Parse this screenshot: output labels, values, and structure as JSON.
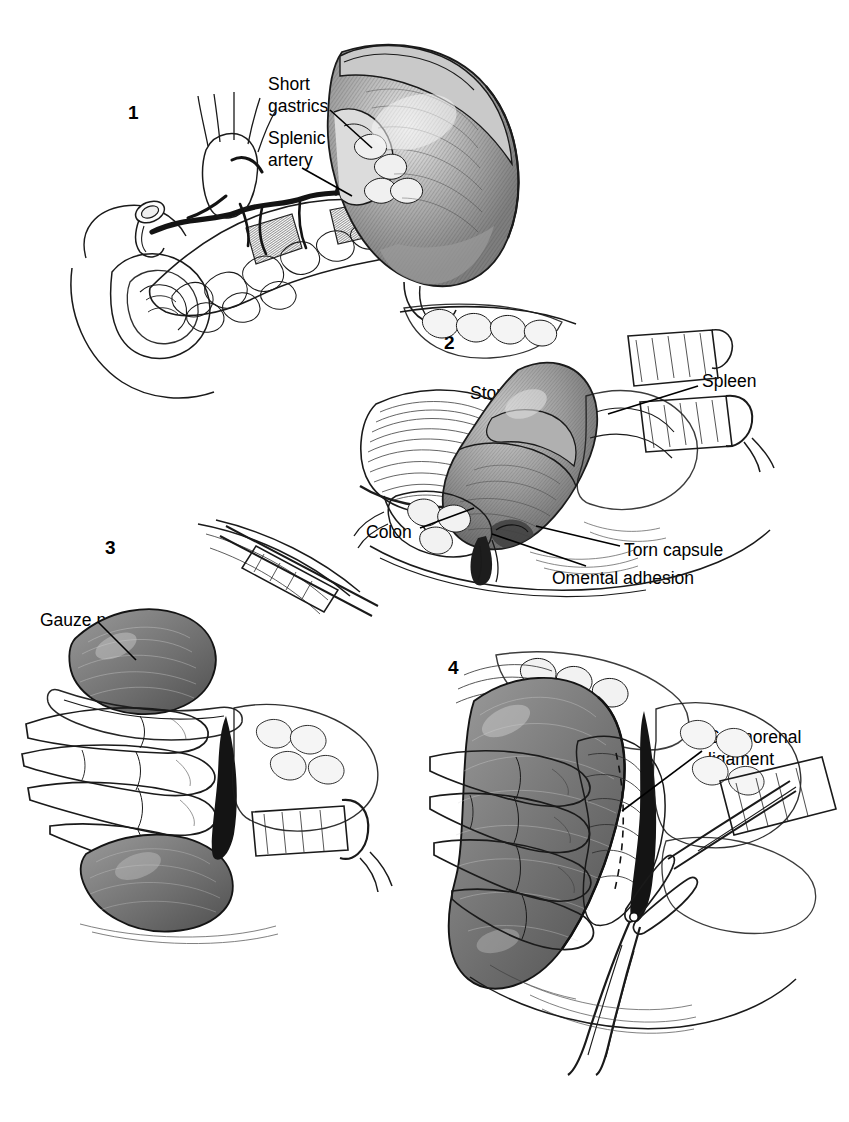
{
  "figure": {
    "background_color": "#ffffff",
    "ink_color": "#1a1a1a",
    "organ_fill_color": "#8e8e8e",
    "panel_count": 4
  },
  "panels": [
    {
      "number": "1",
      "caption": "Anatomy of the spleen, splenic artery and short gastric vessels along the tail of the pancreas",
      "labels": [
        {
          "id": "short-gastrics",
          "text": "Short\ngastrics",
          "line1": "Short",
          "line2": "gastrics"
        },
        {
          "id": "splenic-artery",
          "text": "Splenic\nartery",
          "line1": "Splenic",
          "line2": "artery"
        }
      ],
      "structures": [
        "spleen",
        "splenic artery",
        "short gastric vessels",
        "pancreas",
        "duodenum",
        "stomach outline"
      ]
    },
    {
      "number": "2",
      "caption": "Exposure of the injured spleen showing a torn capsule and omental adhesion",
      "labels": [
        {
          "id": "stomach",
          "text": "Stomach"
        },
        {
          "id": "spleen",
          "text": "Spleen"
        },
        {
          "id": "colon",
          "text": "Colon"
        },
        {
          "id": "torn-capsule",
          "text": "Torn capsule"
        },
        {
          "id": "omental-adhesion",
          "text": "Omental adhesion"
        }
      ],
      "structures": [
        "spleen",
        "stomach",
        "colon",
        "torn capsule",
        "omental adhesion",
        "retractors"
      ]
    },
    {
      "number": "3",
      "caption": "Hand mobilization of the spleen with a gauze pad packed behind it",
      "labels": [
        {
          "id": "gauze-pad",
          "text": "Gauze pad"
        }
      ],
      "structures": [
        "surgeon hand",
        "spleen",
        "gauze pad",
        "retractor"
      ]
    },
    {
      "number": "4",
      "caption": "Division of the splenorenal ligament with scissors",
      "labels": [
        {
          "id": "splenorenal-ligament",
          "text": "Splenorenal\nligament",
          "line1": "Splenorenal",
          "line2": "ligament"
        }
      ],
      "structures": [
        "surgeon hand",
        "spleen",
        "splenorenal ligament",
        "scissors",
        "retractor"
      ]
    }
  ]
}
